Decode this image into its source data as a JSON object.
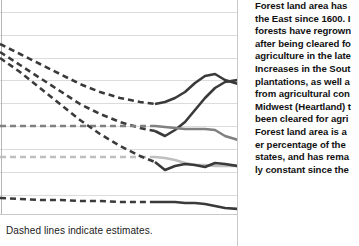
{
  "legend": {
    "note": "Dashed lines indicate estimates."
  },
  "sidebar_text": {
    "lines": [
      "Forest land area has",
      "the East since 1600. I",
      "forests have regrown",
      "after being cleared fo",
      "agriculture in the late",
      "Increases in the Sout",
      "plantations, as well a",
      "from agricultural con",
      "Midwest (Heartland) t",
      "been cleared for agri",
      "Forest land area is a",
      "er percentage of the",
      "states, and has rema",
      "ly constant since the"
    ]
  },
  "colors": {
    "dark": "#3a3a3a",
    "mid_gray": "#808080",
    "light_gray": "#bfbfbf",
    "gridline": "#dcdcdc",
    "axis": "#b5b5b5",
    "text": "#111111"
  },
  "chart_data": {
    "type": "line",
    "title": "",
    "xlabel": "",
    "ylabel": "",
    "grid": true,
    "legend_position": "bottom",
    "annotations": [
      "Dashed lines indicate estimates."
    ],
    "x_pixels": [
      0,
      20,
      40,
      60,
      80,
      100,
      120,
      140,
      155,
      165,
      175,
      185,
      195,
      205,
      215,
      225,
      238
    ],
    "gridline_y": [
      12,
      35,
      58,
      80,
      103,
      126,
      149,
      172,
      195
    ],
    "dash_solid_split_px": 155,
    "series": [
      {
        "name": "north-region",
        "color": "#3a3a3a",
        "width": 2.6,
        "style": "dashed-then-solid",
        "y_pixels": [
          44,
          54,
          64,
          74,
          84,
          92,
          98,
          102,
          104,
          102,
          98,
          92,
          83,
          76,
          74,
          80,
          84
        ]
      },
      {
        "name": "south-region",
        "color": "#3a3a3a",
        "width": 2.6,
        "style": "dashed-then-solid",
        "y_pixels": [
          52,
          65,
          78,
          91,
          104,
          114,
          122,
          128,
          131,
          136,
          130,
          122,
          110,
          98,
          88,
          82,
          80
        ]
      },
      {
        "name": "rocky-mountain-region",
        "color": "#808080",
        "width": 2.6,
        "style": "dashed-then-solid",
        "y_pixels": [
          126,
          126,
          126,
          126,
          126,
          126,
          126,
          126,
          126,
          127,
          128,
          129,
          129,
          129,
          130,
          136,
          140
        ]
      },
      {
        "name": "pacific-coast-region",
        "color": "#bfbfbf",
        "width": 2.6,
        "style": "dashed-then-solid",
        "y_pixels": [
          157,
          157,
          157,
          157,
          157,
          157,
          157,
          157,
          157,
          158,
          160,
          163,
          165,
          165,
          166,
          166,
          166
        ]
      },
      {
        "name": "heartland-region",
        "color": "#3a3a3a",
        "width": 2.6,
        "style": "dashed-then-solid",
        "y_pixels": [
          58,
          72,
          88,
          104,
          120,
          134,
          146,
          156,
          162,
          170,
          166,
          164,
          165,
          167,
          163,
          164,
          166
        ]
      },
      {
        "name": "bottom-series",
        "color": "#3a3a3a",
        "width": 2.6,
        "style": "dashed-then-solid",
        "y_pixels": [
          198,
          199,
          200,
          200,
          201,
          201,
          202,
          202,
          202,
          202,
          202,
          203,
          203,
          204,
          206,
          208,
          209
        ]
      }
    ]
  }
}
